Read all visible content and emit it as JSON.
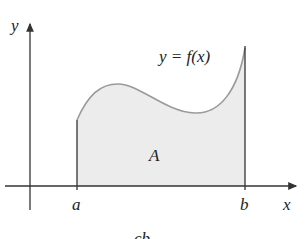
{
  "figure": {
    "y_axis_label": "y",
    "x_axis_label": "x",
    "curve_label": "y = f(x)",
    "area_label": "A",
    "left_bound_label": "a",
    "right_bound_label": "b",
    "caption_fragment": "cb"
  },
  "colors": {
    "axis": "#333333",
    "curve": "#9a9a9a",
    "fill": "#ececec"
  }
}
